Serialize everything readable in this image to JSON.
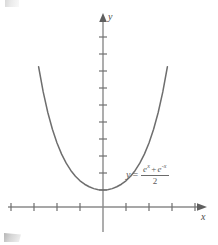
{
  "figure": {
    "title": "",
    "background_color": "#ffffff",
    "width": 218,
    "height": 245,
    "curve_color": "#6e6e6e",
    "axis_color": "#8a8a8a",
    "text_color": "#5c5c5c"
  },
  "axes": {
    "x_label": "x",
    "y_label": "y",
    "origin_px": {
      "x": 103,
      "y": 207
    },
    "x_axis_y_px": 207,
    "y_axis_x_px": 103,
    "x_tick_spacing_px": 23,
    "y_tick_spacing_px": 17,
    "x_ticks_left": 4,
    "x_ticks_right": 4,
    "y_ticks_up": 9,
    "x_tick_half_len_px": 4,
    "y_tick_half_len_px": 4,
    "x_start_px": 8,
    "x_end_px": 200,
    "y_top_px": 14,
    "y_bottom_px": 232
  },
  "equation": {
    "lhs": "y",
    "equals": "=",
    "numerator_e1": "e",
    "numerator_e1_exp": "x",
    "numerator_operator": "+",
    "numerator_e2": "e",
    "numerator_e2_exp": "-x",
    "denominator": "2",
    "plain_text": "y = (e^x + e^-x) / 2"
  },
  "chart_data": {
    "type": "line",
    "title": "",
    "xlabel": "x",
    "ylabel": "y",
    "function": "y = (e^x + e^(-x))/2",
    "function_name": "hyperbolic cosine (catenary)",
    "grid": false,
    "legend": "none",
    "annotations": [
      {
        "text": "y = (e^x + e^-x)/2",
        "x": 1.1,
        "y": 1.05
      }
    ],
    "xlim": [
      -4.2,
      4.2
    ],
    "ylim": [
      -1.5,
      10.5
    ],
    "x": [
      -2.8,
      -2.6,
      -2.4,
      -2.2,
      -2.0,
      -1.8,
      -1.6,
      -1.4,
      -1.2,
      -1.0,
      -0.8,
      -0.6,
      -0.4,
      -0.2,
      0.0,
      0.2,
      0.4,
      0.6,
      0.8,
      1.0,
      1.2,
      1.4,
      1.6,
      1.8,
      2.0,
      2.2,
      2.4,
      2.6,
      2.8
    ],
    "y": [
      8.25,
      6.77,
      5.56,
      4.57,
      3.76,
      3.11,
      2.58,
      2.15,
      1.81,
      1.54,
      1.34,
      1.19,
      1.08,
      1.02,
      1.0,
      1.02,
      1.08,
      1.19,
      1.34,
      1.54,
      1.81,
      2.15,
      2.58,
      3.11,
      3.76,
      4.57,
      5.56,
      6.77,
      8.25
    ],
    "vertex": {
      "x": 0,
      "y": 1
    },
    "x_tick_values": [
      -4,
      -3,
      -2,
      -1,
      0,
      1,
      2,
      3,
      4
    ],
    "y_tick_values": [
      1,
      2,
      3,
      4,
      5,
      6,
      7,
      8,
      9
    ]
  }
}
